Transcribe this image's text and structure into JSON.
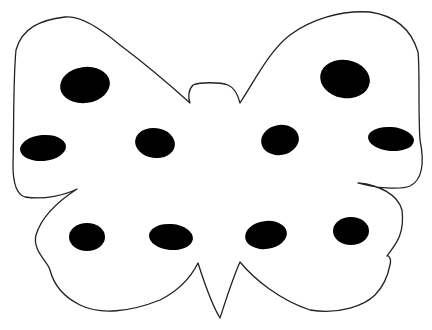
{
  "illustration": {
    "subject": "butterfly-outline-with-spots",
    "outline_color": "#222222",
    "spot_color": "#000000",
    "background_color": "#ffffff",
    "spot_count": 10
  },
  "caption": {
    "text": ""
  }
}
